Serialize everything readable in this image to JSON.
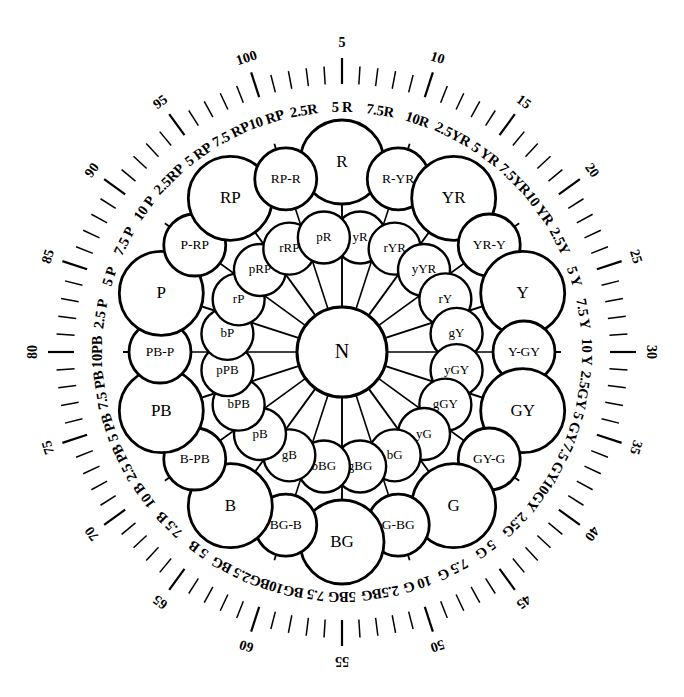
{
  "figure": {
    "center_label": "N",
    "colors": {
      "ink": "#000000",
      "paper": "#ffffff"
    }
  },
  "outer_ring": [
    {
      "label": "R",
      "kind": "principal"
    },
    {
      "label": "R-YR",
      "kind": "intermediate"
    },
    {
      "label": "YR",
      "kind": "principal"
    },
    {
      "label": "YR-Y",
      "kind": "intermediate"
    },
    {
      "label": "Y",
      "kind": "principal"
    },
    {
      "label": "Y-GY",
      "kind": "intermediate"
    },
    {
      "label": "GY",
      "kind": "principal"
    },
    {
      "label": "GY-G",
      "kind": "intermediate"
    },
    {
      "label": "G",
      "kind": "principal"
    },
    {
      "label": "G-BG",
      "kind": "intermediate"
    },
    {
      "label": "BG",
      "kind": "principal"
    },
    {
      "label": "BG-B",
      "kind": "intermediate"
    },
    {
      "label": "B",
      "kind": "principal"
    },
    {
      "label": "B-PB",
      "kind": "intermediate"
    },
    {
      "label": "PB",
      "kind": "principal"
    },
    {
      "label": "PB-P",
      "kind": "intermediate"
    },
    {
      "label": "P",
      "kind": "principal"
    },
    {
      "label": "P-RP",
      "kind": "intermediate"
    },
    {
      "label": "RP",
      "kind": "principal"
    },
    {
      "label": "RP-R",
      "kind": "intermediate"
    }
  ],
  "inner_ring": [
    {
      "label": "yR"
    },
    {
      "label": "rYR"
    },
    {
      "label": "yYR"
    },
    {
      "label": "rY"
    },
    {
      "label": "gY"
    },
    {
      "label": "yGY"
    },
    {
      "label": "gGY"
    },
    {
      "label": "yG"
    },
    {
      "label": "bG"
    },
    {
      "label": "gBG"
    },
    {
      "label": "bBG"
    },
    {
      "label": "gB"
    },
    {
      "label": "pB"
    },
    {
      "label": "bPB"
    },
    {
      "label": "pPB"
    },
    {
      "label": "bP"
    },
    {
      "label": "rP"
    },
    {
      "label": "pRP"
    },
    {
      "label": "rRP"
    },
    {
      "label": "pR"
    }
  ],
  "hue_labels": [
    "2.5R",
    "5 R",
    "7.5R",
    "10R",
    "2.5YR",
    "5 YR",
    "7.5YR",
    "10 YR",
    "2.5Y",
    "5 Y",
    "7.5 Y",
    "10 Y",
    "2.5GY",
    "5 GY",
    "7.5 GY",
    "10GY",
    "2.5G",
    "5 G",
    "7.5 G",
    "10 G",
    "2.5BG",
    "5BG",
    "7.5 BG",
    "10BG",
    "2.5 BG",
    "5 B",
    "7.5 B",
    "10 B",
    "2.5 PB",
    "5 PB",
    "7.5 PB",
    "10PB",
    "2.5 P",
    "5 P",
    "7.5 P",
    "10 P",
    "2.5RP",
    "5 RP",
    "7.5 RP",
    "10 RP"
  ],
  "scale": {
    "description": "Outer graduated scale, 100 divisions, numbered every 5",
    "numbers": [
      "5",
      "10",
      "15",
      "20",
      "25",
      "30",
      "35",
      "40",
      "45",
      "50",
      "55",
      "60",
      "65",
      "70",
      "75",
      "80",
      "85",
      "90",
      "95",
      "100"
    ],
    "total_ticks": 100,
    "numbered_interval": 5
  }
}
